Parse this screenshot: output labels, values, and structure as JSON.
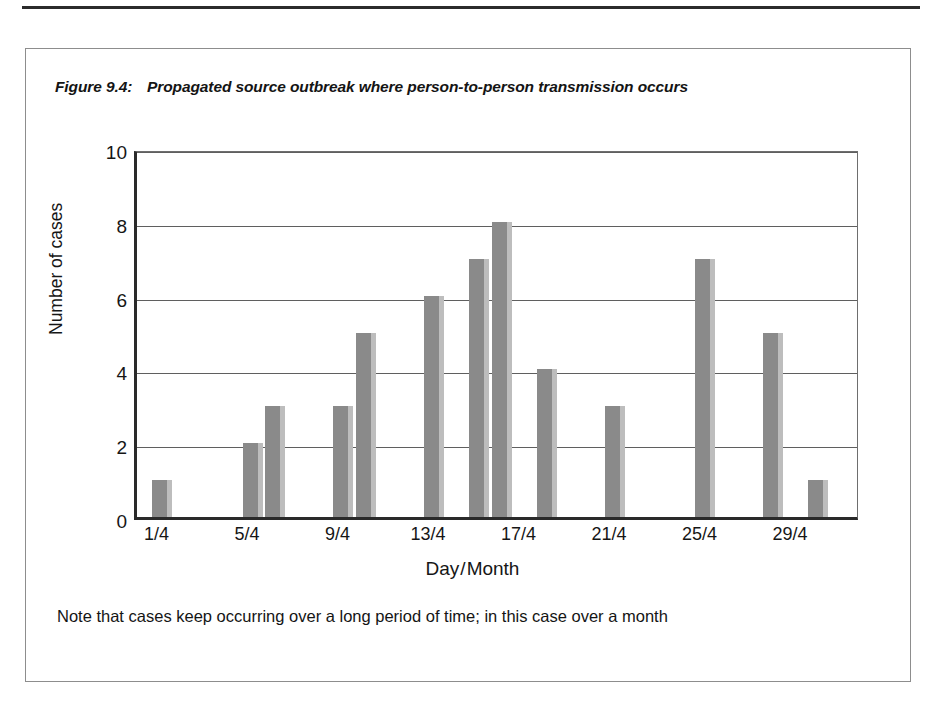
{
  "figure": {
    "number": "Figure 9.4:",
    "title": "Propagated source outbreak where person-to-person transmission occurs",
    "note": "Note that cases keep occurring over a long period of time; in this case over a month"
  },
  "chart_data": {
    "type": "bar",
    "title": "Propagated source outbreak where person-to-person transmission occurs",
    "xlabel": "Day/Month",
    "ylabel": "Number of cases",
    "xlim": [
      0,
      32
    ],
    "ylim": [
      0,
      10
    ],
    "yticks": [
      "0",
      "2",
      "4",
      "6",
      "8",
      "10"
    ],
    "ytick_values": [
      0,
      2,
      4,
      6,
      8,
      10
    ],
    "xticks": [
      "1/4",
      "5/4",
      "9/4",
      "13/4",
      "17/4",
      "21/4",
      "25/4",
      "29/4"
    ],
    "xtick_values": [
      1,
      5,
      9,
      13,
      17,
      21,
      25,
      29
    ],
    "grid": "horizontal",
    "legend": "none",
    "bar_color": "#8a8a8a",
    "bar_shadow_color": "#bdbdbd",
    "categories": [
      "1/4",
      "5/4",
      "6/4",
      "9/4",
      "10/4",
      "13/4",
      "15/4",
      "16/4",
      "18/4",
      "21/4",
      "25/4",
      "28/4",
      "30/4"
    ],
    "x": [
      1,
      5,
      6,
      9,
      10,
      13,
      15,
      16,
      18,
      21,
      25,
      28,
      30
    ],
    "values": [
      1,
      2,
      3,
      3,
      5,
      6,
      7,
      8,
      4,
      3,
      7,
      5,
      1
    ],
    "points": [
      {
        "day": "1/4",
        "x": 1,
        "cases": 1
      },
      {
        "day": "5/4",
        "x": 5,
        "cases": 2
      },
      {
        "day": "6/4",
        "x": 6,
        "cases": 3
      },
      {
        "day": "9/4",
        "x": 9,
        "cases": 3
      },
      {
        "day": "10/4",
        "x": 10,
        "cases": 5
      },
      {
        "day": "13/4",
        "x": 13,
        "cases": 6
      },
      {
        "day": "15/4",
        "x": 15,
        "cases": 7
      },
      {
        "day": "16/4",
        "x": 16,
        "cases": 8
      },
      {
        "day": "18/4",
        "x": 18,
        "cases": 4
      },
      {
        "day": "21/4",
        "x": 21,
        "cases": 3
      },
      {
        "day": "25/4",
        "x": 25,
        "cases": 7
      },
      {
        "day": "28/4",
        "x": 28,
        "cases": 5
      },
      {
        "day": "30/4",
        "x": 30,
        "cases": 1
      }
    ]
  }
}
